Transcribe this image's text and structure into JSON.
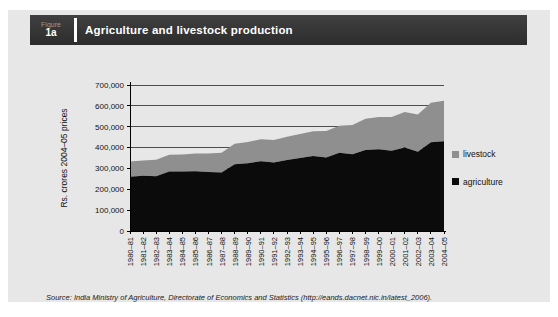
{
  "figure": {
    "label": "Figure",
    "number": "1a",
    "title": "Agriculture and livestock production"
  },
  "chart_data": {
    "type": "area",
    "stacked": true,
    "title": "Agriculture and livestock production",
    "xlabel": "",
    "ylabel": "Rs. crores 2004–05 prices",
    "ylim": [
      0,
      700000
    ],
    "ytick_interval": 100000,
    "ytick_labels": [
      "0",
      "100,000",
      "200,000",
      "300,000",
      "400,000",
      "500,000",
      "600,000",
      "700,000"
    ],
    "grid": true,
    "legend_position": "right",
    "categories": [
      "1980–81",
      "1981–82",
      "1982–83",
      "1983–84",
      "1984–85",
      "1985–86",
      "1986–87",
      "1987–88",
      "1988–89",
      "1989–90",
      "1990–91",
      "1991–92",
      "1992–93",
      "1993–94",
      "1994–95",
      "1995–96",
      "1996–97",
      "1997–98",
      "1998–99",
      "1999–00",
      "2000–01",
      "2001–02",
      "2002–03",
      "2003–04",
      "2004–05"
    ],
    "series": [
      {
        "name": "agriculture",
        "color": "#0b0b0b",
        "values": [
          260000,
          265000,
          262000,
          285000,
          285000,
          287000,
          283000,
          280000,
          320000,
          325000,
          335000,
          328000,
          340000,
          350000,
          360000,
          352000,
          375000,
          368000,
          388000,
          392000,
          385000,
          400000,
          380000,
          425000,
          430000
        ]
      },
      {
        "name": "livestock",
        "color": "#8f8f8f",
        "values": [
          73000,
          73000,
          80000,
          80000,
          82000,
          85000,
          88000,
          95000,
          98000,
          102000,
          105000,
          108000,
          112000,
          115000,
          118000,
          128000,
          130000,
          140000,
          150000,
          155000,
          162000,
          170000,
          178000,
          190000,
          195000
        ]
      }
    ]
  },
  "colors": {
    "card_bg": "#e7e7e7",
    "header_bg": "#333333",
    "gridline": "#4d4d4d",
    "axis": "#000000",
    "agriculture": "#0b0b0b",
    "livestock": "#8f8f8f"
  },
  "source": {
    "prefix": "Source:",
    "text": " India Ministry of Agriculture, Directorate of Economics and Statistics (http://eands.dacnet.nic.in/latest_2006)."
  }
}
